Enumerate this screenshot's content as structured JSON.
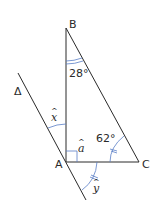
{
  "diagram": {
    "type": "geometry-figure",
    "points": {
      "A": {
        "label": "A"
      },
      "B": {
        "label": "B"
      },
      "C": {
        "label": "C"
      }
    },
    "line_label": "Δ",
    "angles": {
      "B": {
        "value": "28°"
      },
      "C": {
        "value": "62°"
      },
      "a": {
        "label": "a"
      },
      "x": {
        "label": "x"
      },
      "y": {
        "label": "y"
      }
    },
    "colors": {
      "line": "#2a2a2a",
      "arc": "#5b7fc7"
    }
  }
}
